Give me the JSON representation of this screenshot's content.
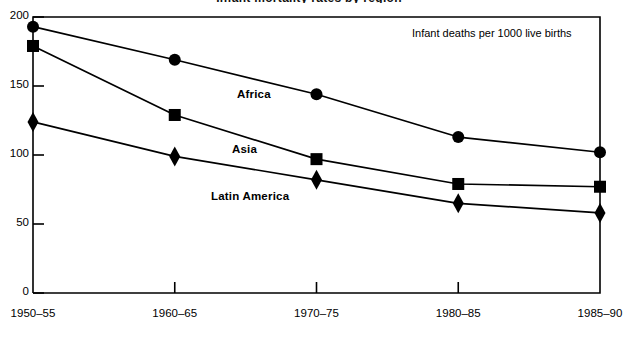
{
  "chart_data": {
    "type": "line",
    "title": "Infant mortality rates by region",
    "annotation": "Infant deaths per 1000 live births",
    "xlabel": "",
    "ylabel": "",
    "categories": [
      "1950–55",
      "1960–65",
      "1970–75",
      "1980–85",
      "1985–90"
    ],
    "ylim": [
      0,
      200
    ],
    "yticks": [
      0,
      50,
      100,
      150,
      200
    ],
    "ytick_labels": [
      "0",
      "50",
      "100",
      "150",
      "200"
    ],
    "grid": false,
    "legend": "inline-labels",
    "series": [
      {
        "name": "Africa",
        "marker": "circle",
        "values": [
          193,
          169,
          144,
          113,
          102
        ]
      },
      {
        "name": "Asia",
        "marker": "square",
        "values": [
          179,
          129,
          97,
          79,
          77
        ]
      },
      {
        "name": "Latin America",
        "marker": "diamond",
        "values": [
          124,
          99,
          82,
          65,
          58
        ]
      }
    ]
  },
  "labels": {
    "africa": "Africa",
    "asia": "Asia",
    "latin_america": "Latin America"
  }
}
